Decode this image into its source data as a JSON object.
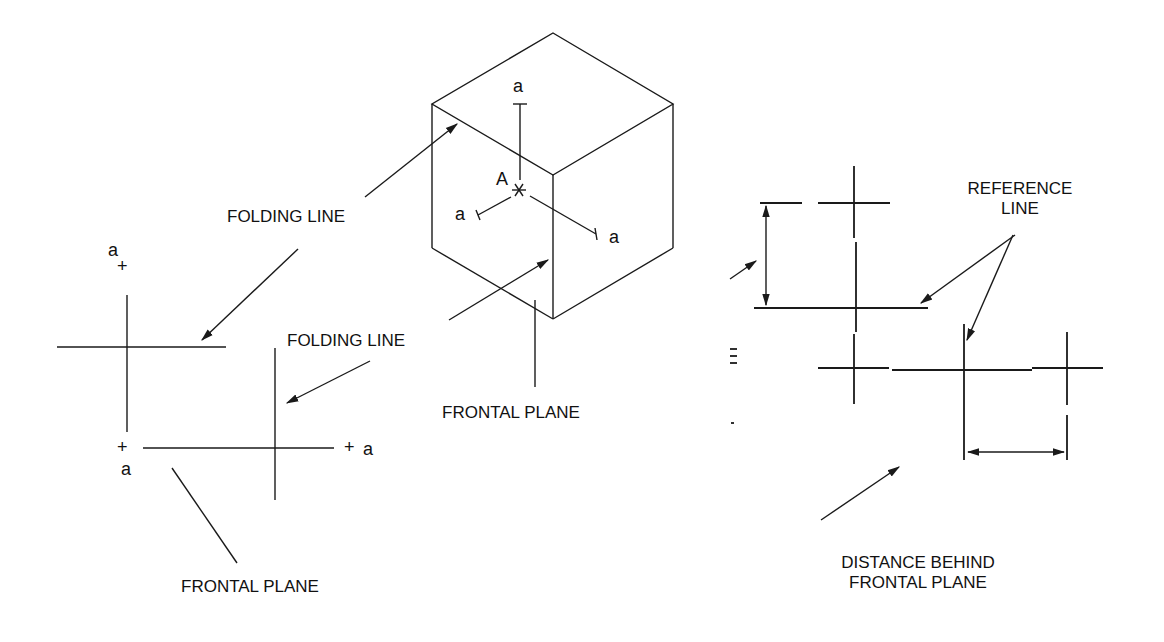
{
  "figure": {
    "labels": {
      "folding_line_top": "FOLDING LINE",
      "folding_line_mid": "FOLDING LINE",
      "frontal_plane_center": "FRONTAL PLANE",
      "frontal_plane_left": "FRONTAL PLANE",
      "reference_line_1": "REFERENCE",
      "reference_line_2": "LINE",
      "distance_behind_1": "DISTANCE BEHIND",
      "distance_behind_2": "FRONTAL PLANE"
    },
    "points": {
      "cube_center": "A",
      "cube_top": "a",
      "cube_left": "a",
      "cube_right": "a",
      "left_top": "a",
      "left_bottom": "a",
      "left_right": "a"
    },
    "markers": {
      "plus": "+"
    },
    "colors": {
      "line": "#1a1a1a",
      "background": "#ffffff"
    }
  }
}
